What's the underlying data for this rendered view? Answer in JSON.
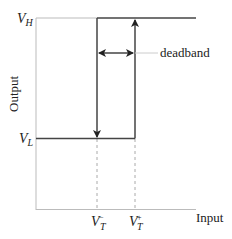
{
  "diagram": {
    "type": "hysteresis-comparator-transfer-characteristic",
    "axes": {
      "x_label": "Input",
      "y_label": "Output"
    },
    "levels": {
      "high": {
        "symbol": "V",
        "subscript": "H"
      },
      "low": {
        "symbol": "V",
        "subscript": "L"
      }
    },
    "thresholds": {
      "lower": {
        "symbol": "V",
        "subscript": "T",
        "superscript": "−"
      },
      "upper": {
        "symbol": "V",
        "subscript": "T",
        "superscript": "+"
      }
    },
    "annotation": {
      "deadband_label": "deadband"
    },
    "colors": {
      "curve": "#444444",
      "axis": "#bbbbbb",
      "guide": "#aaaaaa",
      "text": "#222222"
    }
  }
}
